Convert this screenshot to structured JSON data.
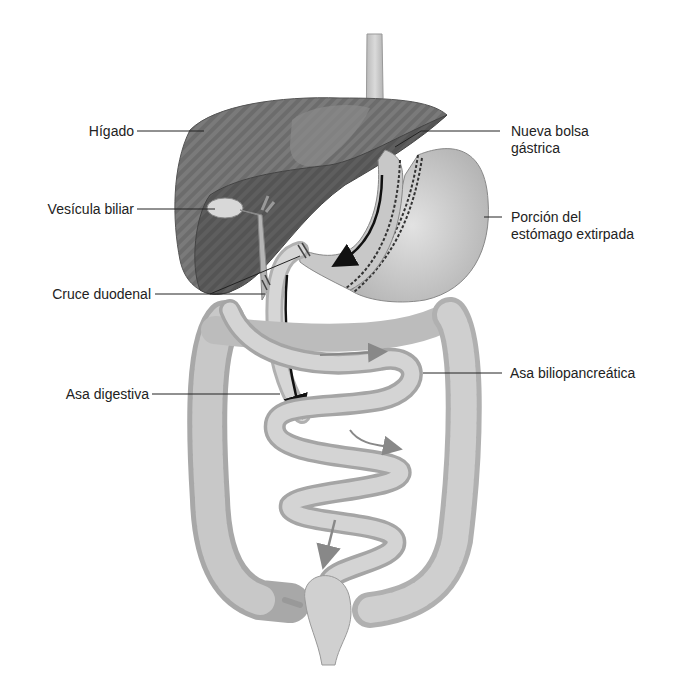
{
  "figure": {
    "background_color": "#ffffff",
    "organ_color_dark": "#6e6e6e",
    "organ_color_mid": "#9a9a9a",
    "organ_color_light": "#cfcfcf",
    "arrow_color": "#111111",
    "arrow_color_secondary": "#8a8a8a"
  },
  "labels": {
    "higado": "Hígado",
    "vesicula": "Vesícula biliar",
    "cruce": "Cruce duodenal",
    "asa_digestiva": "Asa digestiva",
    "nueva_bolsa_line1": "Nueva bolsa",
    "nueva_bolsa_line2": "gástrica",
    "porcion_line1": "Porción del",
    "porcion_line2": "estómago extirpada",
    "asa_biliopancreatica": "Asa biliopancreática"
  }
}
